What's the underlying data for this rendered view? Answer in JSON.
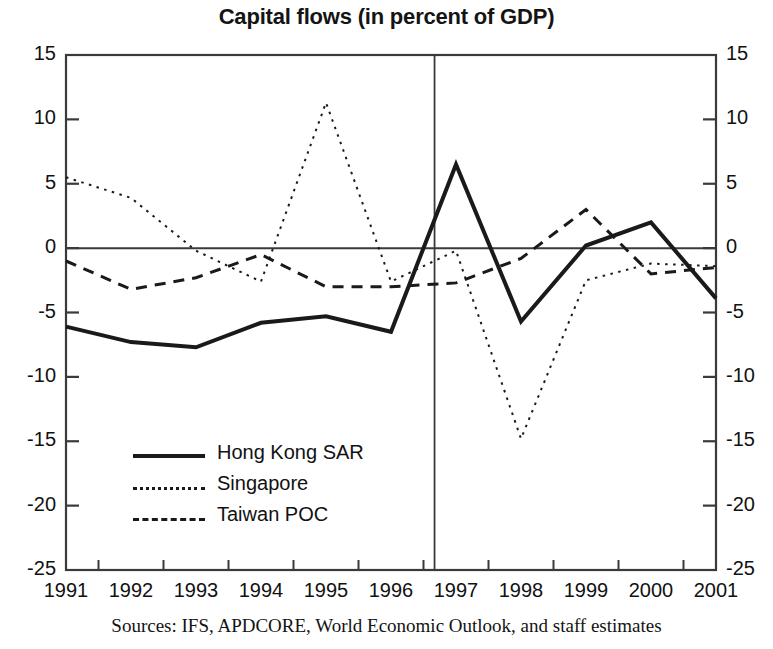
{
  "chart_data": {
    "type": "line",
    "title": "Capital flows (in percent of GDP)",
    "xlabel": "",
    "ylabel": "",
    "categories": [
      "1991",
      "1992",
      "1993",
      "1994",
      "1995",
      "1996",
      "1997",
      "1998",
      "1999",
      "2000",
      "2001"
    ],
    "xlim": [
      1991,
      2001
    ],
    "ylim": [
      -25,
      15
    ],
    "yticks": [
      15,
      10,
      5,
      0,
      -5,
      -10,
      -15,
      -20,
      -25
    ],
    "ytick_labels": [
      "15",
      "10",
      "5",
      "0",
      "-5",
      "-10",
      "-15",
      "-20",
      "-25"
    ],
    "grid": false,
    "zero_line": true,
    "legend_position": "lower-left-inside",
    "dual_y_axis": true,
    "annotations": [
      {
        "name": "forecast-divider",
        "type": "vertical-line",
        "x": 1996.67,
        "description": "vertical line separating actuals from projections"
      }
    ],
    "series": [
      {
        "name": "Hong Kong SAR",
        "style": "solid",
        "width": 4,
        "color": "#1a1a1a",
        "values": [
          -6.1,
          -7.3,
          -7.7,
          -5.8,
          -5.3,
          -6.5,
          6.5,
          -5.7,
          0.2,
          2.0,
          -3.9
        ]
      },
      {
        "name": "Singapore",
        "style": "dotted",
        "width": 2,
        "color": "#1a1a1a",
        "values": [
          5.5,
          3.9,
          -0.2,
          -2.6,
          11.3,
          -2.6,
          -0.2,
          -14.8,
          -2.5,
          -1.2,
          -1.4
        ]
      },
      {
        "name": "Taiwan POC",
        "style": "dashed",
        "width": 3,
        "color": "#1a1a1a",
        "values": [
          -1.0,
          -3.2,
          -2.3,
          -0.5,
          -3.0,
          -3.0,
          -2.7,
          -0.8,
          3.0,
          -2.0,
          -1.5
        ]
      }
    ]
  },
  "legend": {
    "items": [
      {
        "label": "Hong Kong SAR",
        "style": "solid"
      },
      {
        "label": "Singapore",
        "style": "dotted"
      },
      {
        "label": "Taiwan POC",
        "style": "dashed"
      }
    ]
  },
  "footer": {
    "source": "Sources: IFS, APDCORE, World Economic Outlook, and staff estimates"
  },
  "colors": {
    "ink": "#1a1a1a",
    "axis": "#3a3a3a",
    "background": "#ffffff"
  }
}
